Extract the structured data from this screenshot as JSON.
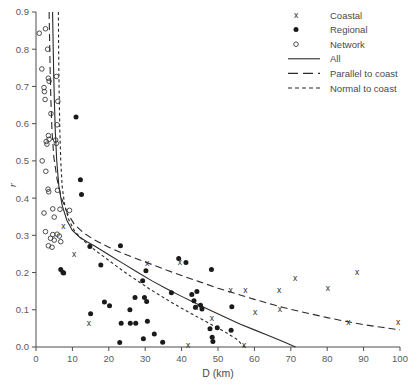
{
  "chart_data": {
    "type": "scatter",
    "title": "",
    "xlabel": "D (km)",
    "ylabel": "r",
    "xlim": [
      0,
      100
    ],
    "ylim": [
      0.0,
      0.9
    ],
    "xticks": [
      0,
      10,
      20,
      30,
      40,
      50,
      60,
      70,
      80,
      90,
      100
    ],
    "xtick_labels": [
      "0",
      "10",
      "20",
      "30",
      "40",
      "50",
      "60",
      "70",
      "80",
      "90",
      "100"
    ],
    "yticks": [
      0.0,
      0.1,
      0.2,
      0.3,
      0.4,
      0.5,
      0.6,
      0.7,
      0.8,
      0.9
    ],
    "ytick_labels": [
      "0.0",
      "0.1",
      "0.2",
      "0.3",
      "0.4",
      "0.5",
      "0.6",
      "0.7",
      "0.8",
      "0.9"
    ],
    "grid": false,
    "legend_position": "top-right",
    "series": [
      {
        "name": "Coastal",
        "marker": "x",
        "points": [
          [
            7.5,
            0.325
          ],
          [
            10.5,
            0.25
          ],
          [
            14.5,
            0.065
          ],
          [
            30.5,
            0.225
          ],
          [
            39.5,
            0.228
          ],
          [
            41.8,
            0.005
          ],
          [
            44.0,
            0.108
          ],
          [
            48.3,
            0.079
          ],
          [
            53.5,
            0.152
          ],
          [
            57.2,
            0.005
          ],
          [
            57.5,
            0.152
          ],
          [
            60.2,
            0.093
          ],
          [
            66.8,
            0.152
          ],
          [
            67.0,
            0.101
          ],
          [
            71.2,
            0.185
          ],
          [
            80.2,
            0.158
          ],
          [
            85.8,
            0.068
          ],
          [
            88.2,
            0.202
          ],
          [
            99.5,
            0.068
          ]
        ]
      },
      {
        "name": "Regional",
        "marker": "filled-circle",
        "points": [
          [
            11.0,
            0.618
          ],
          [
            12.2,
            0.449
          ],
          [
            12.5,
            0.41
          ],
          [
            6.8,
            0.208
          ],
          [
            7.4,
            0.2
          ],
          [
            7.6,
            0.199
          ],
          [
            14.8,
            0.27
          ],
          [
            15.0,
            0.089
          ],
          [
            17.8,
            0.22
          ],
          [
            18.8,
            0.121
          ],
          [
            20.2,
            0.111
          ],
          [
            23.0,
            0.012
          ],
          [
            23.2,
            0.272
          ],
          [
            23.4,
            0.064
          ],
          [
            25.8,
            0.1
          ],
          [
            25.9,
            0.064
          ],
          [
            27.2,
            0.133
          ],
          [
            27.4,
            0.064
          ],
          [
            29.3,
            0.178
          ],
          [
            29.5,
            0.022
          ],
          [
            29.8,
            0.133
          ],
          [
            30.2,
            0.205
          ],
          [
            30.4,
            0.122
          ],
          [
            30.6,
            0.069
          ],
          [
            32.5,
            0.035
          ],
          [
            34.8,
            0.013
          ],
          [
            37.2,
            0.146
          ],
          [
            39.2,
            0.238
          ],
          [
            41.2,
            0.227
          ],
          [
            42.8,
            0.141
          ],
          [
            43.4,
            0.124
          ],
          [
            43.8,
            0.107
          ],
          [
            44.2,
            0.149
          ],
          [
            45.2,
            0.112
          ],
          [
            45.6,
            0.102
          ],
          [
            47.8,
            0.049
          ],
          [
            48.2,
            0.208
          ],
          [
            48.4,
            0.026
          ],
          [
            48.6,
            0.015
          ],
          [
            49.8,
            0.052
          ],
          [
            53.6,
            0.045
          ],
          [
            53.8,
            0.108
          ]
        ]
      },
      {
        "name": "Network",
        "marker": "open-circle",
        "points": [
          [
            0.9,
            0.843
          ],
          [
            2.6,
            0.855
          ],
          [
            1.6,
            0.747
          ],
          [
            3.2,
            0.8
          ],
          [
            3.4,
            0.722
          ],
          [
            3.6,
            0.714
          ],
          [
            2.2,
            0.697
          ],
          [
            2.3,
            0.686
          ],
          [
            2.5,
            0.665
          ],
          [
            5.6,
            0.727
          ],
          [
            4.1,
            0.627
          ],
          [
            6.0,
            0.66
          ],
          [
            5.8,
            0.597
          ],
          [
            3.4,
            0.568
          ],
          [
            3.6,
            0.558
          ],
          [
            2.8,
            0.552
          ],
          [
            3.0,
            0.545
          ],
          [
            5.4,
            0.556
          ],
          [
            5.6,
            0.547
          ],
          [
            1.7,
            0.5
          ],
          [
            2.7,
            0.472
          ],
          [
            3.3,
            0.424
          ],
          [
            3.5,
            0.417
          ],
          [
            5.9,
            0.421
          ],
          [
            4.6,
            0.371
          ],
          [
            2.2,
            0.36
          ],
          [
            5.0,
            0.349
          ],
          [
            6.6,
            0.37
          ],
          [
            2.6,
            0.31
          ],
          [
            4.6,
            0.302
          ],
          [
            5.8,
            0.303
          ],
          [
            6.4,
            0.298
          ],
          [
            4.0,
            0.292
          ],
          [
            5.0,
            0.287
          ],
          [
            6.8,
            0.283
          ],
          [
            3.4,
            0.272
          ],
          [
            4.4,
            0.268
          ],
          [
            9.2,
            0.367
          ]
        ]
      }
    ],
    "curves": [
      {
        "name": "All",
        "style": "solid",
        "points": [
          [
            4.55,
            0.9
          ],
          [
            4.7,
            0.82
          ],
          [
            4.85,
            0.74
          ],
          [
            5.05,
            0.66
          ],
          [
            5.3,
            0.58
          ],
          [
            5.7,
            0.5
          ],
          [
            6.3,
            0.43
          ],
          [
            7.2,
            0.38
          ],
          [
            8.5,
            0.34
          ],
          [
            10.0,
            0.313
          ],
          [
            12.0,
            0.295
          ],
          [
            14.0,
            0.283
          ],
          [
            16.0,
            0.272
          ],
          [
            18.0,
            0.26
          ],
          [
            20.0,
            0.248
          ],
          [
            24.0,
            0.224
          ],
          [
            28.0,
            0.2
          ],
          [
            32.0,
            0.177
          ],
          [
            36.0,
            0.156
          ],
          [
            40.0,
            0.136
          ],
          [
            44.0,
            0.117
          ],
          [
            48.0,
            0.098
          ],
          [
            52.0,
            0.08
          ],
          [
            56.0,
            0.062
          ],
          [
            60.0,
            0.046
          ],
          [
            64.0,
            0.03
          ],
          [
            68.0,
            0.014
          ],
          [
            71.3,
            0.0
          ]
        ]
      },
      {
        "name": "Parallel to coast",
        "style": "long-dash",
        "points": [
          [
            3.6,
            0.9
          ],
          [
            3.75,
            0.82
          ],
          [
            3.9,
            0.74
          ],
          [
            4.1,
            0.66
          ],
          [
            4.4,
            0.58
          ],
          [
            4.9,
            0.51
          ],
          [
            5.8,
            0.45
          ],
          [
            7.0,
            0.4
          ],
          [
            8.6,
            0.36
          ],
          [
            10.5,
            0.33
          ],
          [
            13.0,
            0.307
          ],
          [
            16.0,
            0.288
          ],
          [
            20.0,
            0.268
          ],
          [
            24.0,
            0.251
          ],
          [
            28.0,
            0.236
          ],
          [
            32.0,
            0.221
          ],
          [
            36.0,
            0.206
          ],
          [
            40.0,
            0.192
          ],
          [
            45.0,
            0.175
          ],
          [
            50.0,
            0.158
          ],
          [
            55.0,
            0.143
          ],
          [
            60.0,
            0.128
          ],
          [
            65.0,
            0.114
          ],
          [
            70.0,
            0.101
          ],
          [
            75.0,
            0.09
          ],
          [
            80.0,
            0.079
          ],
          [
            85.0,
            0.069
          ],
          [
            90.0,
            0.06
          ],
          [
            95.0,
            0.053
          ],
          [
            100.0,
            0.046
          ]
        ]
      },
      {
        "name": "Normal to coast",
        "style": "short-dash",
        "points": [
          [
            6.15,
            0.9
          ],
          [
            6.2,
            0.82
          ],
          [
            6.28,
            0.74
          ],
          [
            6.4,
            0.66
          ],
          [
            6.55,
            0.58
          ],
          [
            6.8,
            0.5
          ],
          [
            7.2,
            0.43
          ],
          [
            7.9,
            0.38
          ],
          [
            9.0,
            0.342
          ],
          [
            10.5,
            0.313
          ],
          [
            12.5,
            0.291
          ],
          [
            14.5,
            0.274
          ],
          [
            16.5,
            0.258
          ],
          [
            19.0,
            0.24
          ],
          [
            22.0,
            0.218
          ],
          [
            25.0,
            0.197
          ],
          [
            28.0,
            0.177
          ],
          [
            31.0,
            0.157
          ],
          [
            34.0,
            0.139
          ],
          [
            37.0,
            0.121
          ],
          [
            40.0,
            0.104
          ],
          [
            43.0,
            0.088
          ],
          [
            46.0,
            0.072
          ],
          [
            49.0,
            0.056
          ],
          [
            52.0,
            0.04
          ],
          [
            55.0,
            0.022
          ],
          [
            57.3,
            0.0
          ]
        ]
      }
    ],
    "legend": [
      {
        "label": "Coastal",
        "kind": "marker",
        "marker": "x"
      },
      {
        "label": "Regional",
        "kind": "marker",
        "marker": "filled-circle"
      },
      {
        "label": "Network",
        "kind": "marker",
        "marker": "open-circle"
      },
      {
        "label": "All",
        "kind": "line",
        "style": "solid"
      },
      {
        "label": "Parallel to coast",
        "kind": "line",
        "style": "long-dash"
      },
      {
        "label": "Normal to coast",
        "kind": "line",
        "style": "short-dash"
      }
    ],
    "colors": {
      "ink": "#2b2b2b",
      "axis": "#4d4d4d",
      "text": "#4a4a4a",
      "background": "#ffffff"
    }
  }
}
